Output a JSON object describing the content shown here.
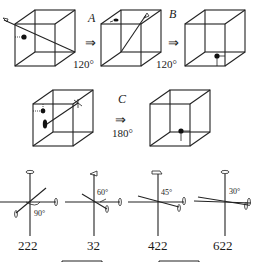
{
  "diagram": {
    "top_row": {
      "steps": [
        {
          "letter": "A",
          "arrow": "⇒",
          "angle": "120°"
        },
        {
          "letter": "B",
          "arrow": "⇒",
          "angle": "120°"
        }
      ]
    },
    "middle_row": {
      "step": {
        "letter": "C",
        "arrow": "⇒",
        "angle": "180°"
      }
    },
    "axis_groups": [
      {
        "name": "222",
        "angle": "90°"
      },
      {
        "name": "32",
        "angle": "60°"
      },
      {
        "name": "422",
        "angle": "45°"
      },
      {
        "name": "622",
        "angle": "30°"
      }
    ],
    "colors": {
      "line": "#222222",
      "background": "#ffffff"
    }
  }
}
